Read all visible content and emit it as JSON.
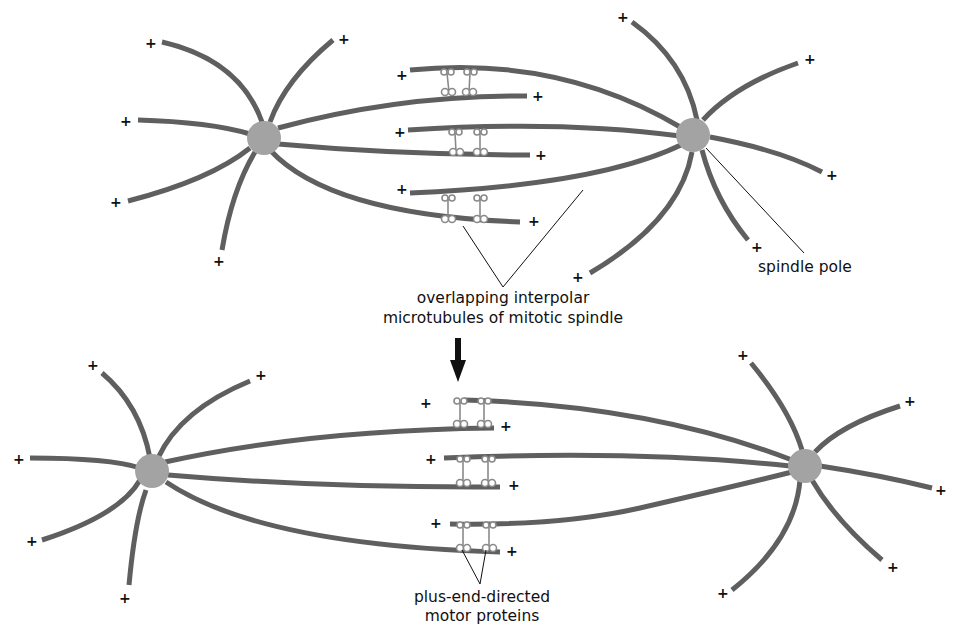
{
  "labels": {
    "spindle_pole": "spindle pole",
    "interpolar_line1": "overlapping interpolar",
    "interpolar_line2": "microtubules of mitotic spindle",
    "motor_line1": "plus-end-directed",
    "motor_line2": "motor proteins"
  },
  "symbols": {
    "plus": "+"
  },
  "colors": {
    "microtubule": "#5f5f5f",
    "pole": "#a3a3a3",
    "motor": "#8a8a8a",
    "text": "#111111"
  },
  "panels": [
    {
      "name": "before-sliding",
      "description": "Overlapping interpolar microtubules between two spindle poles"
    },
    {
      "name": "after-sliding",
      "description": "Motor proteins slide microtubules apart, poles pushed farther apart"
    }
  ]
}
